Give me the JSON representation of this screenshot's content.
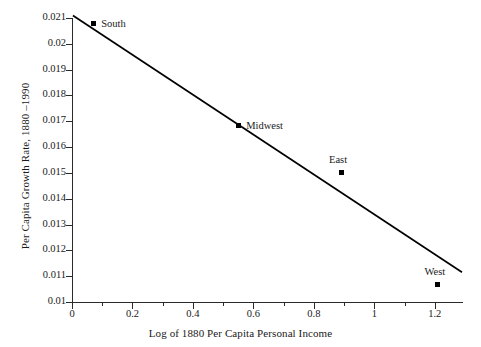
{
  "chart_data": {
    "type": "scatter",
    "title": "",
    "xlabel": "Log of 1880 Per Capita Personal Income",
    "ylabel": "Per Capita Growth Rate, 1880 –1990",
    "xlim": [
      0,
      1.29
    ],
    "ylim": [
      0.01,
      0.021
    ],
    "grid": false,
    "legend_position": "none",
    "xticks": [
      "0",
      "0.2",
      "0.4",
      "0.6",
      "0.8",
      "1",
      "1.2"
    ],
    "xtick_values": [
      0,
      0.2,
      0.4,
      0.6,
      0.8,
      1,
      1.2
    ],
    "xminor_step": 0.1,
    "yticks": [
      "0.01",
      "0.011",
      "0.012",
      "0.013",
      "0.014",
      "0.015",
      "0.016",
      "0.017",
      "0.018",
      "0.019",
      "0.02",
      "0.021"
    ],
    "ytick_values": [
      0.01,
      0.011,
      0.012,
      0.013,
      0.014,
      0.015,
      0.016,
      0.017,
      0.018,
      0.019,
      0.02,
      0.021
    ],
    "points": [
      {
        "label": "South",
        "x": 0.07,
        "y": 0.02077,
        "label_dx": 8,
        "label_dy": -6
      },
      {
        "label": "Midwest",
        "x": 0.55,
        "y": 0.01683,
        "label_dx": 8,
        "label_dy": -6
      },
      {
        "label": "East",
        "x": 0.89,
        "y": 0.015,
        "label_dx": -3,
        "label_dy": -19
      },
      {
        "label": "West",
        "x": 1.21,
        "y": 0.01066,
        "label_dx": -3,
        "label_dy": -19
      }
    ],
    "trendline": {
      "x_start": 0.003,
      "y_start": 0.0211,
      "x_end": 1.29,
      "y_end": 0.011155,
      "slope": -0.00773,
      "intercept": 0.02112
    },
    "series_name": "Regional per capita growth vs 1880 income",
    "marker_color": "#000000",
    "line_color": "#000000",
    "axis_color": "#2a2a2a",
    "background_color": "#ffffff"
  }
}
